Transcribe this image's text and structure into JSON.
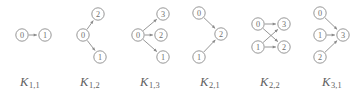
{
  "figure": {
    "width": 362,
    "height": 98,
    "background_color": "#ffffff",
    "stroke_color": "#8a8a8a",
    "text_color": "#5e5e5e",
    "node_label_color": "#6f6f6f"
  },
  "panels": [
    {
      "id": "K11",
      "left": 0,
      "caption_main": "K",
      "caption_sub": "1,1",
      "nodes": [
        {
          "label": "0",
          "cx": 22,
          "cy": 35,
          "r": 6.2
        },
        {
          "label": "1",
          "cx": 45,
          "cy": 35,
          "r": 6.2
        }
      ],
      "edges": [
        {
          "from": "0",
          "to": "1",
          "directed": true
        }
      ]
    },
    {
      "id": "K12",
      "left": 60,
      "caption_main": "K",
      "caption_sub": "1,2",
      "nodes": [
        {
          "label": "0",
          "cx": 23,
          "cy": 35,
          "r": 6.2
        },
        {
          "label": "2",
          "cx": 38,
          "cy": 14,
          "r": 6.2
        },
        {
          "label": "1",
          "cx": 40,
          "cy": 57,
          "r": 6.2
        }
      ],
      "edges": [
        {
          "from": "0",
          "to": "2",
          "directed": true
        },
        {
          "from": "0",
          "to": "1",
          "directed": true
        }
      ]
    },
    {
      "id": "K13",
      "left": 120,
      "caption_main": "K",
      "caption_sub": "1,3",
      "nodes": [
        {
          "label": "0",
          "cx": 18,
          "cy": 35,
          "r": 6.2
        },
        {
          "label": "3",
          "cx": 43,
          "cy": 14,
          "r": 6.2
        },
        {
          "label": "2",
          "cx": 41,
          "cy": 35,
          "r": 6.2
        },
        {
          "label": "1",
          "cx": 43,
          "cy": 57,
          "r": 6.2
        }
      ],
      "edges": [
        {
          "from": "0",
          "to": "3",
          "directed": true
        },
        {
          "from": "0",
          "to": "2",
          "directed": true
        },
        {
          "from": "0",
          "to": "1",
          "directed": true
        }
      ]
    },
    {
      "id": "K21",
      "left": 180,
      "caption_main": "K",
      "caption_sub": "2,1",
      "nodes": [
        {
          "label": "0",
          "cx": 19,
          "cy": 13,
          "r": 6.2
        },
        {
          "label": "2",
          "cx": 41,
          "cy": 34,
          "r": 6.2
        },
        {
          "label": "1",
          "cx": 19,
          "cy": 57,
          "r": 6.2
        }
      ],
      "edges": [
        {
          "from": "0",
          "to": "2",
          "directed": true
        },
        {
          "from": "1",
          "to": "2",
          "directed": true
        }
      ]
    },
    {
      "id": "K22",
      "left": 240,
      "caption_main": "K",
      "caption_sub": "2,2",
      "nodes": [
        {
          "label": "0",
          "cx": 18,
          "cy": 24,
          "r": 6.2
        },
        {
          "label": "3",
          "cx": 44,
          "cy": 24,
          "r": 6.2
        },
        {
          "label": "1",
          "cx": 18,
          "cy": 47,
          "r": 6.2
        },
        {
          "label": "2",
          "cx": 44,
          "cy": 47,
          "r": 6.2
        }
      ],
      "edges": [
        {
          "from": "0",
          "to": "3",
          "directed": true
        },
        {
          "from": "0",
          "to": "2",
          "directed": true
        },
        {
          "from": "1",
          "to": "3",
          "directed": true
        },
        {
          "from": "1",
          "to": "2",
          "directed": true
        }
      ]
    },
    {
      "id": "K31",
      "left": 302,
      "caption_main": "K",
      "caption_sub": "3,1",
      "nodes": [
        {
          "label": "0",
          "cx": 18,
          "cy": 13,
          "r": 6.2
        },
        {
          "label": "1",
          "cx": 18,
          "cy": 35,
          "r": 6.2
        },
        {
          "label": "3",
          "cx": 41,
          "cy": 35,
          "r": 6.2
        },
        {
          "label": "2",
          "cx": 18,
          "cy": 57,
          "r": 6.2
        }
      ],
      "edges": [
        {
          "from": "0",
          "to": "3",
          "directed": true
        },
        {
          "from": "1",
          "to": "3",
          "directed": true
        },
        {
          "from": "2",
          "to": "3",
          "directed": true
        }
      ]
    }
  ]
}
